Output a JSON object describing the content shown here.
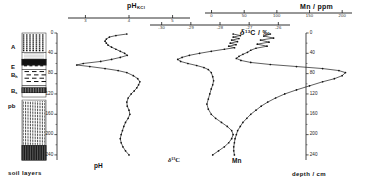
{
  "figure": {
    "caption_elements": [
      "pH_KCl",
      "delta-13C",
      "Mn"
    ],
    "footer_left": "soil layers",
    "footer_right_label": "depth",
    "footer_right_unit": "cm",
    "footer_right": "depth / cm"
  },
  "axes": {
    "ph": {
      "title_main": "pH",
      "title_sub": "KCl",
      "ticks": [
        "3",
        "4",
        "5"
      ],
      "tick_values": [
        3,
        4,
        5
      ],
      "range": [
        2.6,
        5.4
      ]
    },
    "d13c": {
      "title": "δ¹³C / ‰",
      "title_main": "C / ",
      "title_sym": "δ",
      "title_sup": "13",
      "title_unit": "‰",
      "ticks": [
        "-30",
        "-29",
        "-28",
        "-27",
        "-26"
      ],
      "tick_values": [
        -30,
        -29,
        -28,
        -27,
        -26
      ],
      "range": [
        -30.4,
        -25.6
      ]
    },
    "mn": {
      "title": "Mn / ppm",
      "title_main": "Mn / ",
      "title_unit": "ppm",
      "ticks": [
        "0",
        "50",
        "100",
        "150",
        "200"
      ],
      "tick_values": [
        0,
        50,
        100,
        150,
        200
      ],
      "range": [
        -10,
        215
      ]
    },
    "depth": {
      "title": "depth / cm",
      "ticks": [
        "0",
        "40",
        "80",
        "120",
        "160",
        "200",
        "240"
      ],
      "tick_values": [
        0,
        40,
        80,
        120,
        160,
        200,
        240
      ],
      "range": [
        0,
        250
      ],
      "minor_step": 20
    }
  },
  "soil_column": {
    "label": "soil layers",
    "horizons": [
      {
        "name": "A",
        "label": "A",
        "top": 0,
        "bottom": 38,
        "pattern": "dense-organic"
      },
      {
        "name": "E",
        "label": "E",
        "top": 38,
        "bottom": 52,
        "pattern": "pale-eluvial"
      },
      {
        "name": "Bh",
        "label": "B",
        "sub": "h",
        "top": 52,
        "bottom": 72,
        "pattern": "dark-band"
      },
      {
        "name": "Bs",
        "label": "B",
        "sub": "s",
        "top": 72,
        "bottom": 104,
        "pattern": "sparse-dash"
      },
      {
        "name": "pb",
        "label": "pb",
        "top": 104,
        "bottom": 126,
        "pattern": "hatch-solid"
      },
      {
        "name": "C1",
        "label": "",
        "top": 132,
        "bottom": 222,
        "pattern": "vertical-streak"
      },
      {
        "name": "C2",
        "label": "",
        "top": 222,
        "bottom": 250,
        "pattern": "dark-dense"
      }
    ]
  },
  "chart_data": {
    "type": "line",
    "title": "",
    "orientation": "depth-profile (y = depth, inverted)",
    "ylabel": "depth / cm",
    "ylim": [
      0,
      250
    ],
    "grid": false,
    "legend": "inline curve labels",
    "series": [
      {
        "name": "pH",
        "label": "pH",
        "xlabel": "pH_KCl",
        "xlim": [
          2.6,
          5.4
        ],
        "marker": "dot",
        "points": [
          [
            3.95,
            2
          ],
          [
            3.7,
            5
          ],
          [
            3.55,
            8
          ],
          [
            3.48,
            12
          ],
          [
            3.45,
            16
          ],
          [
            3.48,
            20
          ],
          [
            3.52,
            24
          ],
          [
            3.6,
            28
          ],
          [
            3.7,
            32
          ],
          [
            3.8,
            36
          ],
          [
            3.9,
            40
          ],
          [
            3.96,
            44
          ],
          [
            3.8,
            48
          ],
          [
            3.6,
            52
          ],
          [
            3.35,
            56
          ],
          [
            2.95,
            60
          ],
          [
            2.8,
            63
          ],
          [
            3.1,
            66
          ],
          [
            3.45,
            70
          ],
          [
            3.75,
            74
          ],
          [
            3.95,
            78
          ],
          [
            4.1,
            84
          ],
          [
            4.2,
            90
          ],
          [
            4.25,
            96
          ],
          [
            4.22,
            102
          ],
          [
            4.18,
            108
          ],
          [
            4.12,
            114
          ],
          [
            4.05,
            120
          ],
          [
            3.98,
            128
          ],
          [
            3.95,
            136
          ],
          [
            3.96,
            144
          ],
          [
            4.0,
            152
          ],
          [
            4.02,
            160
          ],
          [
            3.98,
            168
          ],
          [
            3.92,
            176
          ],
          [
            3.88,
            184
          ],
          [
            3.85,
            192
          ],
          [
            3.82,
            200
          ],
          [
            3.8,
            208
          ],
          [
            3.82,
            216
          ],
          [
            3.86,
            224
          ],
          [
            3.92,
            232
          ],
          [
            4.0,
            240
          ]
        ]
      },
      {
        "name": "delta13C",
        "label": "δ¹³C",
        "xlabel": "δ¹³C / ‰",
        "xlim": [
          -30.4,
          -25.6
        ],
        "marker": "dot",
        "points": [
          [
            -27.55,
            2
          ],
          [
            -27.3,
            5
          ],
          [
            -27.55,
            8
          ],
          [
            -27.35,
            11
          ],
          [
            -27.6,
            14
          ],
          [
            -27.4,
            17
          ],
          [
            -27.65,
            20
          ],
          [
            -27.45,
            23
          ],
          [
            -27.7,
            26
          ],
          [
            -27.5,
            29
          ],
          [
            -27.85,
            32
          ],
          [
            -28.3,
            36
          ],
          [
            -28.7,
            40
          ],
          [
            -29.05,
            44
          ],
          [
            -29.3,
            48
          ],
          [
            -29.45,
            52
          ],
          [
            -29.35,
            56
          ],
          [
            -29.1,
            60
          ],
          [
            -28.8,
            64
          ],
          [
            -28.55,
            68
          ],
          [
            -28.4,
            72
          ],
          [
            -28.3,
            78
          ],
          [
            -28.25,
            86
          ],
          [
            -28.22,
            94
          ],
          [
            -28.25,
            102
          ],
          [
            -28.3,
            110
          ],
          [
            -28.35,
            120
          ],
          [
            -28.4,
            130
          ],
          [
            -28.45,
            140
          ],
          [
            -28.4,
            150
          ],
          [
            -28.3,
            160
          ],
          [
            -28.15,
            168
          ],
          [
            -27.95,
            176
          ],
          [
            -27.75,
            184
          ],
          [
            -27.6,
            192
          ],
          [
            -27.55,
            200
          ],
          [
            -27.6,
            208
          ],
          [
            -27.7,
            216
          ],
          [
            -27.85,
            224
          ],
          [
            -28.05,
            232
          ],
          [
            -28.25,
            240
          ]
        ]
      },
      {
        "name": "Mn",
        "label": "Mn",
        "xlabel": "Mn / ppm",
        "xlim": [
          -10,
          215
        ],
        "marker": "dot",
        "points": [
          [
            90,
            2
          ],
          [
            80,
            6
          ],
          [
            95,
            10
          ],
          [
            75,
            14
          ],
          [
            88,
            18
          ],
          [
            70,
            22
          ],
          [
            85,
            26
          ],
          [
            68,
            30
          ],
          [
            60,
            34
          ],
          [
            55,
            38
          ],
          [
            48,
            42
          ],
          [
            42,
            46
          ],
          [
            38,
            50
          ],
          [
            45,
            54
          ],
          [
            60,
            58
          ],
          [
            90,
            62
          ],
          [
            130,
            66
          ],
          [
            170,
            70
          ],
          [
            195,
            74
          ],
          [
            205,
            78
          ],
          [
            200,
            84
          ],
          [
            188,
            90
          ],
          [
            170,
            96
          ],
          [
            150,
            104
          ],
          [
            130,
            112
          ],
          [
            112,
            120
          ],
          [
            98,
            128
          ],
          [
            86,
            136
          ],
          [
            76,
            144
          ],
          [
            68,
            152
          ],
          [
            60,
            160
          ],
          [
            54,
            168
          ],
          [
            48,
            176
          ],
          [
            44,
            184
          ],
          [
            40,
            192
          ],
          [
            38,
            200
          ],
          [
            36,
            208
          ],
          [
            35,
            216
          ],
          [
            34,
            224
          ],
          [
            34,
            232
          ],
          [
            35,
            240
          ]
        ]
      }
    ]
  }
}
